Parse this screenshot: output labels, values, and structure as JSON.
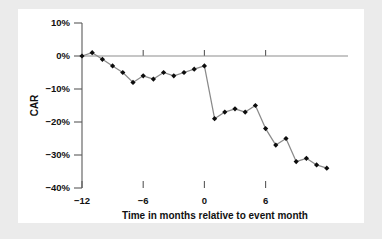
{
  "figure": {
    "background_color": "#ebebeb",
    "panel_color": "#ffffff",
    "line_color": "#8a8a8a",
    "marker_color": "#0d0d0d",
    "axis_color": "#5a5a5a"
  },
  "chart_data": {
    "type": "line",
    "title": "",
    "subtitle": "",
    "xlabel": "Time in months relative to event month",
    "ylabel": "CAR",
    "xlim": [
      -12,
      12
    ],
    "ylim": [
      -40,
      10
    ],
    "grid": false,
    "legend": null,
    "zero_reference_line": 0,
    "y_ticks": [
      10,
      0,
      -10,
      -20,
      -30,
      -40
    ],
    "y_tick_labels": [
      "10%",
      "0%",
      "−10%",
      "−20%",
      "−30%",
      "−40%"
    ],
    "x_ticks": [
      -12,
      -6,
      0,
      6
    ],
    "x_tick_labels": [
      "−12",
      "−6",
      "0",
      "6"
    ],
    "x": [
      -12,
      -11,
      -10,
      -9,
      -8,
      -7,
      -6,
      -5,
      -4,
      -3,
      -2,
      -1,
      0,
      1,
      2,
      3,
      4,
      5,
      6,
      7,
      8,
      9,
      10,
      11,
      12
    ],
    "y": [
      0,
      1,
      -1,
      -3,
      -5,
      -8,
      -6,
      -7,
      -5,
      -6,
      -5,
      -4,
      -3,
      -19,
      -17,
      -16,
      -17,
      -15,
      -22,
      -27,
      -25,
      -32,
      -31,
      -33,
      -34
    ],
    "series": [
      {
        "name": "CAR",
        "values": [
          0,
          1,
          -1,
          -3,
          -5,
          -8,
          -6,
          -7,
          -5,
          -6,
          -5,
          -4,
          -3,
          -19,
          -17,
          -16,
          -17,
          -15,
          -22,
          -27,
          -25,
          -32,
          -31,
          -33,
          -34
        ]
      }
    ]
  },
  "axes": {
    "y_label": "CAR",
    "x_label": "Time in months relative to event month",
    "y_tick_labels": [
      "10%",
      "−0%",
      "−10%",
      "−20%",
      "−30%",
      "−40%"
    ],
    "x_tick_labels": [
      "−12",
      "−6",
      "0",
      "6"
    ]
  }
}
